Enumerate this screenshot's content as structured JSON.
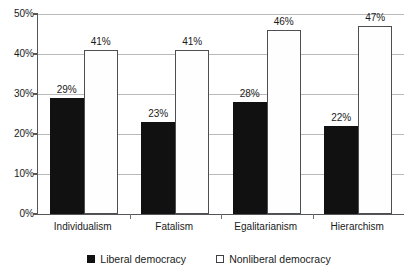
{
  "chart_data": {
    "type": "bar",
    "title": "",
    "xlabel": "",
    "ylabel": "",
    "ylim": [
      0,
      50
    ],
    "y_tick_step": 10,
    "y_tick_labels": [
      "0%",
      "10%",
      "20%",
      "30%",
      "40%",
      "50%"
    ],
    "y_tick_values": [
      0,
      10,
      20,
      30,
      40,
      50
    ],
    "grid": true,
    "legend_position": "bottom-center",
    "categories": [
      "Individualism",
      "Fatalism",
      "Egalitarianism",
      "Hierarchism"
    ],
    "series": [
      {
        "name": "Liberal democracy",
        "color": "#111111",
        "marker": "filled-square",
        "values": [
          29,
          23,
          28,
          22
        ],
        "labels": [
          "29%",
          "23%",
          "28%",
          "22%"
        ]
      },
      {
        "name": "Nonliberal democracy",
        "color": "#ffffff",
        "marker": "hollow-square",
        "values": [
          41,
          41,
          46,
          47
        ],
        "labels": [
          "41%",
          "41%",
          "46%",
          "47%"
        ]
      }
    ]
  },
  "legend": {
    "items": [
      {
        "label": "Liberal democracy",
        "swatch": "filled-square"
      },
      {
        "label": "Nonliberal democracy",
        "swatch": "hollow-square"
      }
    ]
  }
}
